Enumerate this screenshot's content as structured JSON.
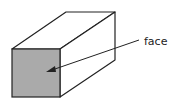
{
  "diagram": {
    "label": "face",
    "shape": "rectangular-prism",
    "colors": {
      "front_face": "#aaaaaa",
      "outline": "#222222",
      "background": "#ffffff"
    }
  }
}
